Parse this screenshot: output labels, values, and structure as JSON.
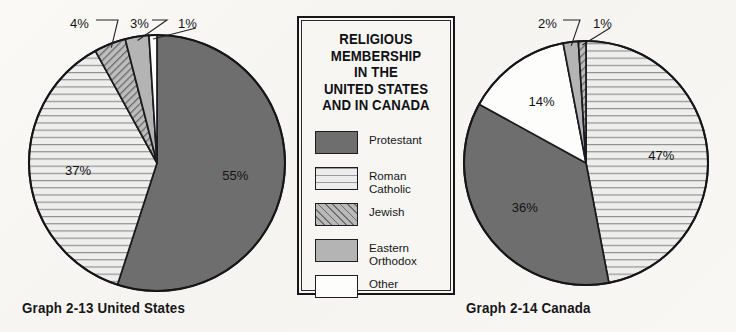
{
  "page": {
    "background_color": "#f7f6f3"
  },
  "legend": {
    "title_lines": [
      "RELIGIOUS",
      "MEMBERSHIP",
      "IN THE",
      "UNITED STATES",
      "AND IN CANADA"
    ],
    "items": [
      {
        "label_lines": [
          "Protestant"
        ],
        "swatch": "sw-protestant",
        "swatch_name": "legend-swatch-protestant",
        "color": "#6e6e6e",
        "pattern": "solid"
      },
      {
        "label_lines": [
          "Roman",
          "Catholic"
        ],
        "swatch": "sw-catholic",
        "swatch_name": "legend-swatch-roman-catholic",
        "color": "#ececec",
        "pattern": "horizontal-lines"
      },
      {
        "label_lines": [
          "Jewish"
        ],
        "swatch": "sw-jewish",
        "swatch_name": "legend-swatch-jewish",
        "color": "#b9b9b9",
        "pattern": "diagonal-hatch"
      },
      {
        "label_lines": [
          "Eastern",
          "Orthodox"
        ],
        "swatch": "sw-orthodox",
        "swatch_name": "legend-swatch-eastern-orthodox",
        "color": "#b4b4b4",
        "pattern": "solid"
      },
      {
        "label_lines": [
          "Other"
        ],
        "swatch": "sw-other",
        "swatch_name": "legend-swatch-other",
        "color": "#fdfdfb",
        "pattern": "solid"
      }
    ]
  },
  "captions": {
    "us": "Graph 2-13 United States",
    "canada": "Graph 2-14 Canada"
  },
  "chart_data": [
    {
      "type": "pie",
      "name": "united-states",
      "title": "Graph 2-13 United States",
      "categories": [
        "Protestant",
        "Roman Catholic",
        "Jewish",
        "Eastern Orthodox",
        "Other"
      ],
      "values": [
        55,
        37,
        4,
        3,
        1
      ],
      "value_labels": [
        "55%",
        "37%",
        "4%",
        "3%",
        "1%"
      ],
      "label_placement": [
        "inside",
        "inside",
        "outside",
        "outside",
        "outside"
      ],
      "start_angle_deg": 0,
      "direction": "clockwise",
      "units": "percent",
      "center": {
        "x": 157,
        "y": 163
      },
      "radius": 128,
      "fills": [
        "solid-dark-gray",
        "horizontal-lines",
        "diagonal-hatch",
        "solid-light-gray",
        "white"
      ]
    },
    {
      "type": "pie",
      "name": "canada",
      "title": "Graph 2-14 Canada",
      "categories": [
        "Roman Catholic",
        "Protestant",
        "Other",
        "Eastern Orthodox",
        "Jewish"
      ],
      "values": [
        47,
        36,
        14,
        2,
        1
      ],
      "value_labels": [
        "47%",
        "36%",
        "14%",
        "2%",
        "1%"
      ],
      "label_placement": [
        "inside",
        "inside",
        "inside",
        "outside",
        "outside"
      ],
      "start_angle_deg": 0,
      "direction": "clockwise",
      "units": "percent",
      "center": {
        "x": 126,
        "y": 163
      },
      "radius": 122,
      "fills": [
        "horizontal-lines",
        "solid-dark-gray",
        "white",
        "solid-light-gray",
        "diagonal-hatch"
      ]
    }
  ]
}
